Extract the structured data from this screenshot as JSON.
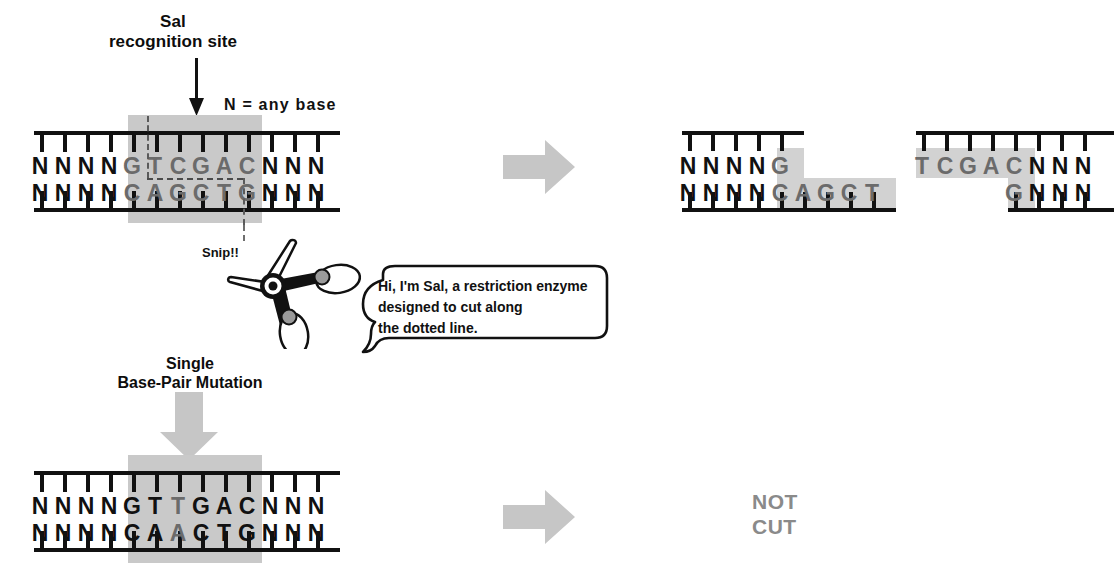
{
  "figure": {
    "title_line1": "Sal",
    "title_line2": "recognition site",
    "legend": "N = any base",
    "snip_label": "Snip!!",
    "mutation_title_line1": "Single",
    "mutation_title_line2": "Base-Pair Mutation",
    "not_cut_line1": "NOT",
    "not_cut_line2": "CUT",
    "speech_line1": "Hi, I'm Sal, a restriction enzyme",
    "speech_line2": "designed to cut along",
    "speech_line3": "the dotted line."
  },
  "colors": {
    "ink": "#111111",
    "recognition_base": "#6b6b6b",
    "highlight": "#c9c9c9",
    "gray_arrow": "#c6c6c6",
    "not_cut_text": "#8a8a8a"
  },
  "intact_dna": {
    "top_strand": [
      "N",
      "N",
      "N",
      "N",
      "G",
      "T",
      "C",
      "G",
      "A",
      "C",
      "N",
      "N",
      "N"
    ],
    "bottom_strand": [
      "N",
      "N",
      "N",
      "N",
      "C",
      "A",
      "G",
      "C",
      "T",
      "G",
      "N",
      "N",
      "N"
    ],
    "recognition_start_index": 4,
    "recognition_end_index": 9,
    "recognition_sequence_top": "GTCGAC",
    "recognition_sequence_bottom": "CAGCTG",
    "cut_after_index_top": 4,
    "cut_after_index_bottom": 8
  },
  "cut_fragment_left": {
    "top_strand": [
      "N",
      "N",
      "N",
      "N",
      "G"
    ],
    "bottom_strand": [
      "N",
      "N",
      "N",
      "N",
      "C",
      "A",
      "G",
      "C",
      "T"
    ],
    "highlight_top_from_index": 4,
    "highlight_bottom_from_index": 4
  },
  "cut_fragment_right": {
    "top_strand": [
      "T",
      "C",
      "G",
      "A",
      "C",
      "N",
      "N",
      "N"
    ],
    "bottom_strand": [
      "G",
      "N",
      "N",
      "N"
    ],
    "highlight_top_to_index": 4,
    "highlight_bottom_to_index": 0
  },
  "mutant_dna": {
    "top_strand": [
      "N",
      "N",
      "N",
      "N",
      "G",
      "T",
      "T",
      "G",
      "A",
      "C",
      "N",
      "N",
      "N"
    ],
    "bottom_strand": [
      "N",
      "N",
      "N",
      "N",
      "C",
      "A",
      "A",
      "C",
      "T",
      "G",
      "N",
      "N",
      "N"
    ],
    "mutated_index": 6,
    "mutated_top_base": "T",
    "mutated_bottom_base": "A",
    "recognition_start_index": 4,
    "recognition_end_index": 9,
    "result": "NOT CUT"
  },
  "icons": {
    "site_pointer": "down-arrow-icon",
    "process_arrow": "right-block-arrow-icon",
    "mutation_arrow": "down-block-arrow-icon",
    "enzyme": "scissors-icon",
    "speech": "speech-bubble-icon"
  }
}
